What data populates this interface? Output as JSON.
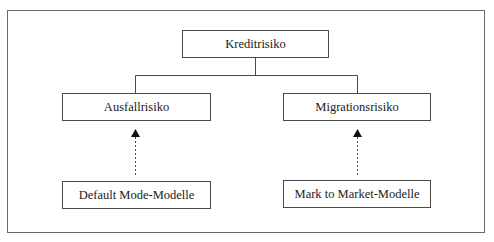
{
  "diagram": {
    "type": "hierarchy",
    "root": {
      "label": "Kreditrisiko"
    },
    "children": [
      {
        "label": "Ausfallrisiko",
        "model": {
          "label": "Default Mode-Modelle"
        }
      },
      {
        "label": "Migrationsrisiko",
        "model": {
          "label": "Mark to Market-Modelle"
        }
      }
    ],
    "edges": [
      {
        "from": "Kreditrisiko",
        "to": "Ausfallrisiko",
        "style": "solid"
      },
      {
        "from": "Kreditrisiko",
        "to": "Migrationsrisiko",
        "style": "solid"
      },
      {
        "from": "Default Mode-Modelle",
        "to": "Ausfallrisiko",
        "style": "dashed-arrow"
      },
      {
        "from": "Mark to Market-Modelle",
        "to": "Migrationsrisiko",
        "style": "dashed-arrow"
      }
    ],
    "colors": {
      "line": "#4a4a4a",
      "frame": "#6a6a6a",
      "text": "#1a1a1a",
      "background": "#ffffff"
    }
  }
}
